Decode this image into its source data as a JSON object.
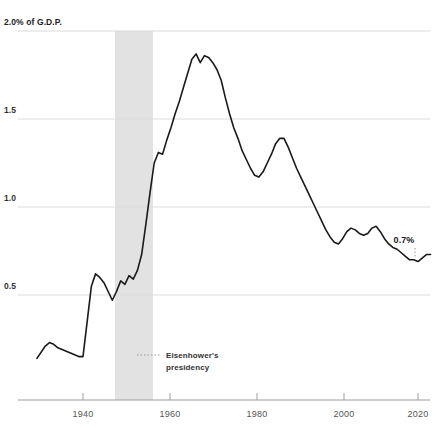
{
  "chart_data": {
    "type": "line",
    "title": "",
    "subtitle": "",
    "xlabel": "",
    "ylabel": "",
    "axis_top_label": "2.0% of G.D.P.",
    "ytick_labels": [
      "1.5",
      "1.0",
      "0.5"
    ],
    "ytick_values": [
      1.5,
      1.0,
      0.5
    ],
    "ylim": [
      0.0,
      2.0
    ],
    "xlim": [
      1929,
      2024
    ],
    "xtick_labels": [
      "1940",
      "1960",
      "1980",
      "2000",
      "2020"
    ],
    "xtick_values": [
      1940,
      1960,
      1980,
      2000,
      2020
    ],
    "grid": true,
    "grid_lines_at": [
      2.0,
      1.5,
      1.0,
      0.5
    ],
    "legend": "none",
    "line_color": "#1a1a1a",
    "grid_color": "#d8d8d8",
    "axis_color": "#9a9a9a",
    "band_color": "#e0e0e0",
    "series": [
      {
        "name": "Share of G.D.P.",
        "x": [
          1929,
          1931,
          1932,
          1933,
          1934,
          1935,
          1936,
          1937,
          1938,
          1939,
          1940,
          1941,
          1942,
          1943,
          1944,
          1945,
          1946,
          1947,
          1948,
          1949,
          1950,
          1951,
          1952,
          1953,
          1954,
          1955,
          1956,
          1957,
          1958,
          1959,
          1960,
          1961,
          1962,
          1963,
          1964,
          1965,
          1966,
          1967,
          1968,
          1969,
          1970,
          1971,
          1972,
          1973,
          1974,
          1975,
          1976,
          1977,
          1978,
          1979,
          1980,
          1981,
          1982,
          1983,
          1984,
          1985,
          1986,
          1987,
          1988,
          1989,
          1990,
          1991,
          1992,
          1993,
          1994,
          1995,
          1996,
          1997,
          1998,
          1999,
          2000,
          2001,
          2002,
          2003,
          2004,
          2005,
          2006,
          2007,
          2008,
          2009,
          2010,
          2011,
          2012,
          2013,
          2014,
          2015,
          2016,
          2017,
          2018,
          2019,
          2020,
          2021,
          2022,
          2023
        ],
        "y": [
          0.14,
          0.21,
          0.23,
          0.22,
          0.2,
          0.19,
          0.18,
          0.17,
          0.16,
          0.15,
          0.15,
          0.35,
          0.55,
          0.62,
          0.6,
          0.57,
          0.52,
          0.47,
          0.52,
          0.58,
          0.56,
          0.61,
          0.59,
          0.64,
          0.73,
          0.9,
          1.08,
          1.25,
          1.31,
          1.3,
          1.38,
          1.45,
          1.53,
          1.6,
          1.68,
          1.76,
          1.84,
          1.87,
          1.82,
          1.86,
          1.85,
          1.82,
          1.78,
          1.72,
          1.62,
          1.53,
          1.45,
          1.39,
          1.32,
          1.27,
          1.22,
          1.18,
          1.17,
          1.2,
          1.25,
          1.3,
          1.36,
          1.39,
          1.39,
          1.34,
          1.28,
          1.22,
          1.17,
          1.12,
          1.07,
          1.02,
          0.97,
          0.92,
          0.87,
          0.83,
          0.8,
          0.79,
          0.82,
          0.86,
          0.88,
          0.87,
          0.85,
          0.84,
          0.85,
          0.88,
          0.89,
          0.86,
          0.82,
          0.79,
          0.77,
          0.76,
          0.74,
          0.72,
          0.7,
          0.7,
          0.69,
          0.71,
          0.73,
          0.73
        ]
      }
    ],
    "shaded_band": {
      "label": "Eisenhower's presidency",
      "start": 1953,
      "end": 1961,
      "color": "#e0e0e0"
    },
    "annotations": [
      {
        "name": "eisenhower-annotation",
        "text_line1": "Eisenhower's",
        "text_line2": "presidency",
        "leader": "dotted"
      },
      {
        "name": "end-value-label",
        "text": "0.7%"
      }
    ]
  }
}
